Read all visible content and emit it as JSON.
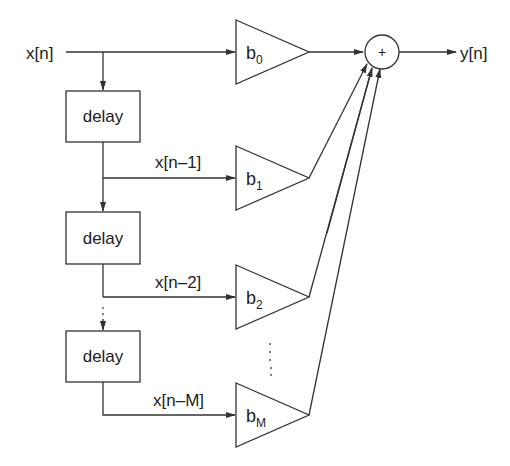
{
  "diagram": {
    "type": "FIR filter block diagram (tapped delay line)",
    "input_label": "x[n]",
    "output_label": "y[n]",
    "sum_symbol": "+",
    "delay_blocks": [
      {
        "label": "delay"
      },
      {
        "label": "delay"
      },
      {
        "label": "delay"
      }
    ],
    "taps": [
      {
        "signal": "x[n]",
        "coef": "b",
        "sub": "0"
      },
      {
        "signal": "x[n–1]",
        "coef": "b",
        "sub": "1"
      },
      {
        "signal": "x[n–2]",
        "coef": "b",
        "sub": "2"
      },
      {
        "signal": "x[n–M]",
        "coef": "b",
        "sub": "M"
      }
    ],
    "ellipsis": "⋮"
  }
}
